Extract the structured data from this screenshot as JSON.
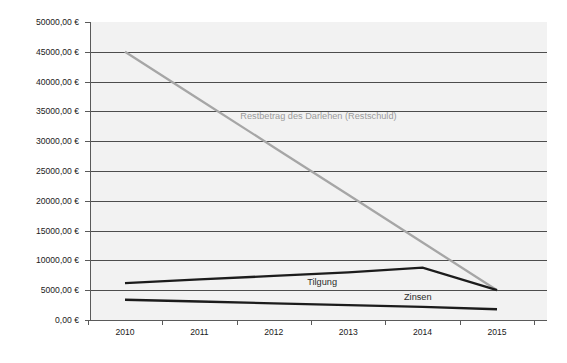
{
  "chart_data": {
    "type": "line",
    "title": "",
    "xlabel": "",
    "ylabel": "",
    "categories": [
      "2010",
      "2011",
      "2012",
      "2013",
      "2014",
      "2015"
    ],
    "x": [
      2010,
      2011,
      2012,
      2013,
      2014,
      2015
    ],
    "ylim": [
      0,
      50000
    ],
    "ytick_values": [
      0,
      5000,
      10000,
      15000,
      20000,
      25000,
      30000,
      35000,
      40000,
      45000,
      50000
    ],
    "ytick_labels": [
      "0,00 €",
      "5000,00 €",
      "10000,00 €",
      "15000,00 €",
      "20000,00 €",
      "25000,00 €",
      "30000,00 €",
      "35000,00 €",
      "40000,00 €",
      "45000,00 €",
      "50000,00 €"
    ],
    "grid": true,
    "legend_position": "inline-annotations",
    "currency_symbol": "€",
    "series": [
      {
        "name": "Restbetrag des Darlehen (Restschuld)",
        "color": "#a6a6a6",
        "values": [
          45000,
          37000,
          29000,
          21000,
          13000,
          5000
        ],
        "label_text": "Restbetrag des Darlehen (Restschuld)",
        "label_x": 2011.55,
        "label_y": 33800
      },
      {
        "name": "Tilgung",
        "color": "#1c1c1c",
        "values": [
          6200,
          6800,
          7400,
          8000,
          8800,
          5000
        ],
        "label_text": "Tilgung",
        "label_x": 2012.45,
        "label_y": 5900
      },
      {
        "name": "Zinsen",
        "color": "#1c1c1c",
        "values": [
          3400,
          3100,
          2800,
          2500,
          2200,
          1800
        ],
        "label_text": "Zinsen",
        "label_x": 2013.75,
        "label_y": 3300
      }
    ]
  },
  "colors": {
    "plot_background": "#f2f2f2",
    "page_background": "#ffffff",
    "gridline": "#4d4d4d",
    "axis": "#5a5a5a",
    "series_dark": "#1c1c1c",
    "series_gray": "#a6a6a6",
    "tick_label": "#1a1a1a"
  }
}
